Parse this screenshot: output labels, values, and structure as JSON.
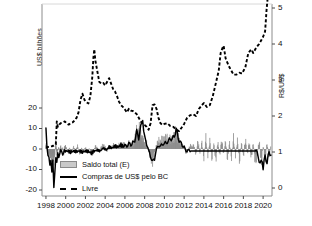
{
  "figure": {
    "axis_titles": {
      "left": "US$ bilhões",
      "right": "R$/US$"
    },
    "colors": {
      "bar_fill": "#c9c9c9",
      "bar_edge": "#8a8a8a",
      "line_purchases": "#000000",
      "line_exchange": "#000000",
      "spine": "#8c8c8c",
      "text": "#111111"
    }
  },
  "legend": {
    "position": "lower-center-left",
    "entries": [
      {
        "label": "Saldo total (E)",
        "marker": "filled-rect"
      },
      {
        "label": "Compras de US$ pelo BC",
        "marker": "solid-line"
      },
      {
        "label": "Livre",
        "marker": "dashed-line"
      }
    ]
  },
  "chart_data": {
    "type": "line",
    "title": "",
    "subtitle": "",
    "xlabel": "",
    "ylabel": "US$ bilhões",
    "y2label": "R$/US$",
    "grid": false,
    "xlim": [
      1997.6,
      2020.9
    ],
    "ylim": [
      -20,
      20
    ],
    "y2lim": [
      0,
      5
    ],
    "xticks": [
      1998,
      2000,
      2002,
      2004,
      2006,
      2008,
      2010,
      2012,
      2014,
      2016,
      2018,
      2020
    ],
    "xtick_labels": [
      "1998",
      "2000",
      "2002",
      "2004",
      "2006",
      "2008",
      "2010",
      "2012",
      "2014",
      "2016",
      "2018",
      "2020"
    ],
    "yticks": [
      -20,
      -10,
      0,
      10,
      20
    ],
    "ytick_labels": [
      "-20",
      "-10",
      "0",
      "10",
      "20"
    ],
    "y2ticks": [
      0,
      1,
      2,
      3,
      4,
      5
    ],
    "y2tick_labels": [
      "0",
      "1",
      "2",
      "3",
      "4",
      "5"
    ],
    "panels": [
      {
        "name": "upper-exchange-rate",
        "axis": "right",
        "series_names": [
          "Livre"
        ]
      },
      {
        "name": "lower-flows",
        "axis": "left",
        "series_names": [
          "Saldo total (E)",
          "Compras de US$ pelo BC"
        ]
      }
    ],
    "series": [
      {
        "name": "Livre",
        "type": "line",
        "style": "dashed",
        "axis": "right",
        "units": "R$/US$",
        "x": [
          1998.0,
          1998.2,
          1998.4,
          1998.6,
          1998.8,
          1999.0,
          1999.1,
          1999.2,
          1999.3,
          1999.5,
          1999.7,
          1999.9,
          2000.1,
          2000.3,
          2000.5,
          2000.7,
          2000.9,
          2001.1,
          2001.3,
          2001.5,
          2001.7,
          2001.9,
          2002.1,
          2002.3,
          2002.5,
          2002.7,
          2002.8,
          2002.9,
          2003.0,
          2003.2,
          2003.4,
          2003.6,
          2003.8,
          2004.0,
          2004.2,
          2004.4,
          2004.6,
          2004.8,
          2005.0,
          2005.2,
          2005.4,
          2005.6,
          2005.8,
          2006.0,
          2006.2,
          2006.4,
          2006.6,
          2006.8,
          2007.0,
          2007.2,
          2007.4,
          2007.6,
          2007.8,
          2008.0,
          2008.2,
          2008.4,
          2008.6,
          2008.8,
          2009.0,
          2009.2,
          2009.4,
          2009.6,
          2009.8,
          2010.0,
          2010.3,
          2010.6,
          2010.9,
          2011.2,
          2011.5,
          2011.8,
          2012.0,
          2012.3,
          2012.6,
          2012.9,
          2013.2,
          2013.5,
          2013.8,
          2014.0,
          2014.3,
          2014.6,
          2014.9,
          2015.2,
          2015.5,
          2015.7,
          2015.9,
          2016.0,
          2016.2,
          2016.5,
          2016.8,
          2017.0,
          2017.3,
          2017.6,
          2017.9,
          2018.0,
          2018.2,
          2018.5,
          2018.8,
          2019.0,
          2019.3,
          2019.6,
          2019.9,
          2020.0,
          2020.2,
          2020.35,
          2020.5,
          2020.65,
          2020.8
        ],
        "y": [
          1.12,
          1.14,
          1.15,
          1.16,
          1.18,
          1.21,
          1.85,
          1.7,
          1.75,
          1.8,
          1.82,
          1.85,
          1.8,
          1.76,
          1.8,
          1.82,
          1.88,
          1.95,
          2.1,
          2.45,
          2.62,
          2.45,
          2.38,
          2.35,
          2.55,
          3.1,
          3.6,
          3.85,
          3.55,
          3.25,
          2.95,
          2.9,
          2.92,
          2.85,
          2.95,
          3.05,
          2.9,
          2.75,
          2.68,
          2.55,
          2.4,
          2.3,
          2.25,
          2.18,
          2.1,
          2.2,
          2.15,
          2.14,
          2.1,
          2.05,
          1.95,
          1.85,
          1.78,
          1.75,
          1.7,
          1.62,
          1.8,
          2.3,
          2.32,
          2.2,
          1.95,
          1.8,
          1.75,
          1.78,
          1.8,
          1.72,
          1.7,
          1.62,
          1.58,
          1.7,
          1.78,
          1.95,
          2.02,
          2.05,
          2.0,
          2.2,
          2.3,
          2.36,
          2.25,
          2.3,
          2.55,
          2.9,
          3.25,
          3.75,
          3.9,
          3.95,
          3.6,
          3.4,
          3.25,
          3.15,
          3.15,
          3.2,
          3.18,
          3.25,
          3.35,
          3.75,
          3.85,
          3.75,
          3.9,
          4.0,
          4.15,
          4.2,
          4.35,
          4.95,
          5.4,
          5.25,
          5.3
        ]
      },
      {
        "name": "Saldo total (E)",
        "type": "bar",
        "axis": "left",
        "units": "US$ bilhões",
        "note": "monthly total FX flow balance, gray vertical bars, ranges roughly -8 to +10",
        "x": [
          1998.0,
          1998.1,
          1998.2,
          1998.3,
          1998.4,
          1998.5,
          1998.6,
          1998.7,
          1998.8,
          1998.9,
          1999.0,
          1999.1,
          1999.2,
          1999.3,
          1999.4,
          1999.5,
          1999.6,
          1999.7,
          1999.8,
          1999.9,
          2000.0,
          2000.2,
          2000.4,
          2000.6,
          2000.8,
          2001.0,
          2001.2,
          2001.4,
          2001.6,
          2001.8,
          2002.0,
          2002.2,
          2002.4,
          2002.6,
          2002.8,
          2003.0,
          2003.2,
          2003.4,
          2003.6,
          2003.8,
          2004.0,
          2004.2,
          2004.4,
          2004.6,
          2004.8,
          2005.0,
          2005.2,
          2005.4,
          2005.6,
          2005.8,
          2006.0,
          2006.2,
          2006.4,
          2006.6,
          2006.8,
          2007.0,
          2007.1,
          2007.2,
          2007.3,
          2007.4,
          2007.5,
          2007.6,
          2007.7,
          2007.8,
          2007.9,
          2008.0,
          2008.2,
          2008.4,
          2008.6,
          2008.8,
          2009.0,
          2009.2,
          2009.4,
          2009.6,
          2009.8,
          2010.0,
          2010.2,
          2010.4,
          2010.6,
          2010.8,
          2011.0,
          2011.2,
          2011.4,
          2011.6,
          2011.8,
          2012.0,
          2012.2,
          2012.4,
          2012.6,
          2012.8,
          2013.0,
          2013.2,
          2013.4,
          2013.6,
          2013.8,
          2014.0,
          2014.2,
          2014.4,
          2014.6,
          2014.8,
          2015.0,
          2015.2,
          2015.4,
          2015.6,
          2015.8,
          2016.0,
          2016.2,
          2016.4,
          2016.6,
          2016.8,
          2017.0,
          2017.2,
          2017.4,
          2017.6,
          2017.8,
          2018.0,
          2018.2,
          2018.4,
          2018.6,
          2018.8,
          2019.0,
          2019.2,
          2019.4,
          2019.6,
          2019.8,
          2020.0,
          2020.2,
          2020.4,
          2020.6,
          2020.8
        ],
        "y": [
          2.0,
          1.0,
          -1.5,
          -3.0,
          -2.0,
          -4.0,
          -5.0,
          -3.0,
          -6.0,
          -2.0,
          3.0,
          -2.0,
          -1.0,
          1.0,
          -1.5,
          1.5,
          -1.0,
          0.5,
          -2.0,
          1.0,
          1.5,
          -1.0,
          0.5,
          -1.5,
          1.0,
          -0.5,
          1.5,
          -2.0,
          0.5,
          -1.0,
          1.0,
          -1.5,
          0.5,
          -3.0,
          -1.0,
          1.5,
          0.5,
          -1.0,
          1.0,
          2.0,
          1.0,
          -1.0,
          1.5,
          0.5,
          2.0,
          1.5,
          0.5,
          2.0,
          1.0,
          2.5,
          2.0,
          1.0,
          3.0,
          1.5,
          2.5,
          4.0,
          6.0,
          8.0,
          5.0,
          7.0,
          9.5,
          6.0,
          4.0,
          5.0,
          3.0,
          2.0,
          3.0,
          -1.0,
          -4.0,
          -6.0,
          -2.0,
          2.0,
          4.0,
          3.0,
          5.0,
          4.0,
          6.0,
          3.0,
          5.0,
          4.0,
          6.0,
          8.0,
          5.0,
          3.0,
          2.0,
          1.0,
          -2.0,
          -1.0,
          2.0,
          1.0,
          2.0,
          -3.0,
          4.0,
          -2.0,
          3.0,
          -4.0,
          5.0,
          -3.0,
          4.0,
          -5.0,
          3.0,
          -6.0,
          4.0,
          -4.0,
          5.0,
          -3.0,
          4.0,
          -5.0,
          3.0,
          -4.0,
          5.0,
          -3.0,
          4.0,
          -6.0,
          3.0,
          -4.0,
          5.0,
          -3.0,
          4.0,
          -5.0,
          3.0,
          -6.0,
          -4.0,
          5.0,
          -8.0,
          2.0,
          -5.0,
          3.0,
          -4.0,
          2.0
        ]
      },
      {
        "name": "Compras de US$ pelo BC",
        "type": "line",
        "style": "solid",
        "axis": "left",
        "units": "US$ bilhões",
        "note": "BC dollar purchases; deep negative spike in 1998-1999 to about -19; active 2006-2012; flat at ~-1 from 2012 to 2019; negative again 2019-2020",
        "x": [
          1998.0,
          1998.1,
          1998.2,
          1998.3,
          1998.4,
          1998.5,
          1998.6,
          1998.7,
          1998.8,
          1998.9,
          1999.0,
          1999.1,
          1999.2,
          1999.3,
          1999.5,
          1999.7,
          1999.9,
          2000.2,
          2000.5,
          2000.8,
          2001.1,
          2001.4,
          2001.7,
          2002.0,
          2002.3,
          2002.6,
          2002.9,
          2003.2,
          2003.5,
          2003.8,
          2004.1,
          2004.4,
          2004.7,
          2005.0,
          2005.3,
          2005.6,
          2005.9,
          2006.1,
          2006.3,
          2006.5,
          2006.7,
          2006.9,
          2007.0,
          2007.2,
          2007.4,
          2007.6,
          2007.8,
          2007.9,
          2008.0,
          2008.2,
          2008.4,
          2008.6,
          2008.8,
          2009.0,
          2009.2,
          2009.4,
          2009.6,
          2009.8,
          2010.0,
          2010.2,
          2010.4,
          2010.6,
          2010.8,
          2011.0,
          2011.2,
          2011.4,
          2011.6,
          2011.8,
          2012.0,
          2012.2,
          2012.4,
          2012.6,
          2019.3,
          2019.5,
          2019.7,
          2019.9,
          2020.0,
          2020.2,
          2020.4,
          2020.6,
          2020.8
        ],
        "y": [
          10.2,
          2.0,
          -3.0,
          -5.5,
          -8.0,
          -4.0,
          -11.0,
          -7.0,
          -19.0,
          -10.0,
          -4.0,
          -8.0,
          -2.0,
          -3.0,
          -1.0,
          -2.0,
          -1.0,
          -1.0,
          -1.5,
          -1.0,
          -1.2,
          -1.0,
          -1.5,
          -1.0,
          -1.2,
          -2.0,
          -1.0,
          -0.5,
          -1.0,
          0.5,
          -0.5,
          1.0,
          0.5,
          1.5,
          1.0,
          2.0,
          1.0,
          2.0,
          1.5,
          3.0,
          2.0,
          3.5,
          5.0,
          8.0,
          6.0,
          10.0,
          15.5,
          9.0,
          5.0,
          3.0,
          -1.0,
          -3.0,
          -7.0,
          -4.0,
          0.0,
          2.0,
          1.0,
          3.0,
          2.0,
          4.0,
          3.0,
          6.0,
          4.0,
          7.0,
          9.0,
          6.0,
          3.0,
          2.0,
          1.0,
          -1.0,
          -0.5,
          -1.0,
          -1.0,
          -3.0,
          -8.0,
          -5.0,
          -9.0,
          -4.0,
          -6.0,
          -2.0,
          -3.0
        ]
      }
    ]
  }
}
